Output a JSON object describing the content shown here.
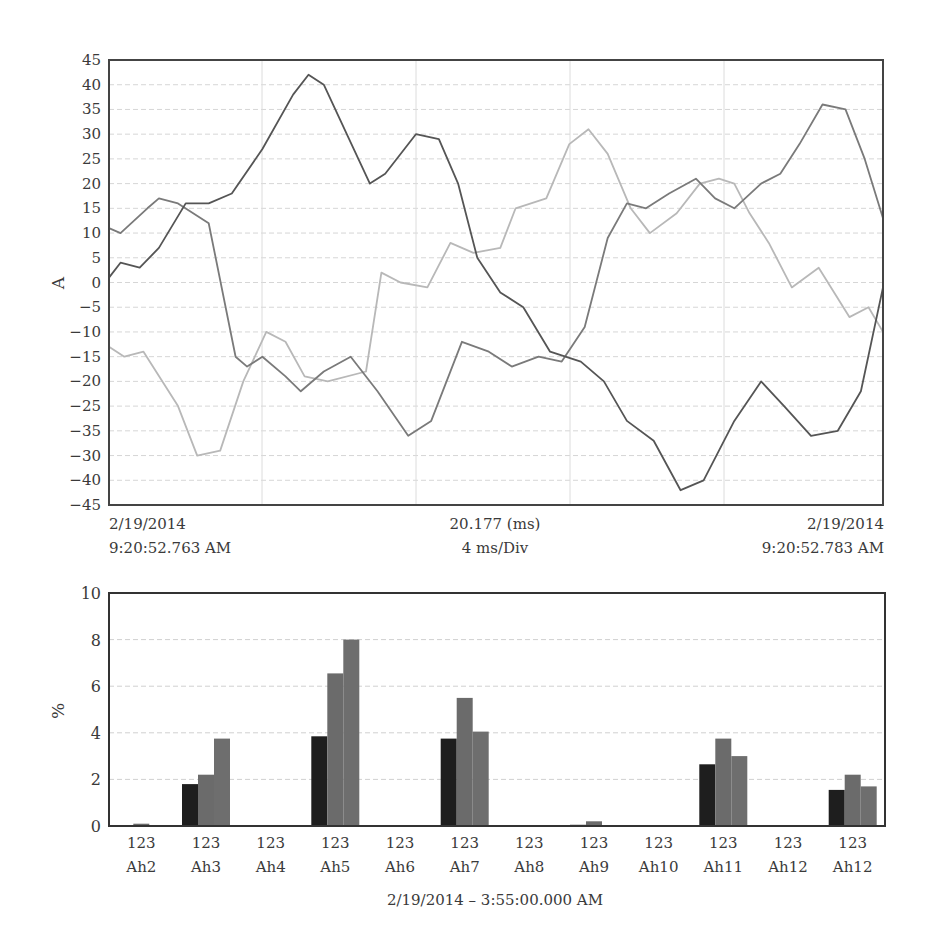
{
  "chart_data": [
    {
      "type": "line",
      "title": "",
      "xlabel": "",
      "ylabel": "A",
      "ylim": [
        -45,
        45
      ],
      "grid": true,
      "y_tick_labels": [
        "45",
        "40",
        "35",
        "30",
        "25",
        "20",
        "15",
        "10",
        "5",
        "0",
        "-5",
        "-10",
        "-15",
        "-20",
        "-25",
        "-35",
        "-30",
        "-40",
        "-45"
      ],
      "x_labels": {
        "left_date": "2/19/2014",
        "left_time": "9:20:52.763 AM",
        "center_top": "20.177 (ms)",
        "center_bottom": "4 ms/Div",
        "right_date": "2/19/2014",
        "right_time": "9:20:52.783 AM"
      },
      "x_range_ms": [
        0,
        20.177
      ],
      "series": [
        {
          "name": "phase-1",
          "color": "#555555",
          "x_ms": [
            0,
            0.3,
            0.8,
            1.3,
            2.0,
            2.6,
            3.2,
            4.0,
            4.8,
            5.2,
            5.6,
            6.2,
            6.8,
            7.2,
            8.0,
            8.6,
            9.1,
            9.6,
            10.2,
            10.8,
            11.5,
            12.3,
            12.9,
            13.5,
            14.2,
            14.9,
            15.5,
            16.3,
            17.0,
            17.6,
            18.3,
            19.0,
            19.6,
            20.177
          ],
          "values": [
            1,
            4,
            3,
            7,
            16,
            16,
            18,
            27,
            38,
            42,
            40,
            30,
            20,
            22,
            30,
            29,
            20,
            5,
            -2,
            -5,
            -14,
            -16,
            -20,
            -28,
            -32,
            -42,
            -40,
            -28,
            -20,
            -25,
            -31,
            -30,
            -22,
            -1
          ]
        },
        {
          "name": "phase-2",
          "color": "#7a7a7a",
          "x_ms": [
            0,
            0.3,
            1.0,
            1.3,
            1.8,
            2.6,
            3.3,
            3.6,
            4.0,
            4.6,
            5.0,
            5.6,
            6.3,
            7.0,
            7.8,
            8.4,
            9.2,
            9.9,
            10.5,
            11.2,
            11.8,
            12.4,
            13.0,
            13.5,
            14.0,
            14.6,
            15.3,
            15.8,
            16.3,
            17.0,
            17.5,
            18.0,
            18.6,
            19.2,
            19.7,
            20.177
          ],
          "values": [
            11,
            10,
            15,
            17,
            16,
            12,
            -15,
            -17,
            -15,
            -19,
            -22,
            -18,
            -15,
            -22,
            -31,
            -28,
            -12,
            -14,
            -17,
            -15,
            -16,
            -9,
            9,
            16,
            15,
            18,
            21,
            17,
            15,
            20,
            22,
            28,
            36,
            35,
            25,
            13
          ]
        },
        {
          "name": "phase-3",
          "color": "#b8b8b8",
          "x_ms": [
            0,
            0.4,
            0.9,
            1.8,
            2.3,
            2.9,
            3.5,
            4.1,
            4.6,
            5.1,
            5.7,
            6.7,
            7.1,
            7.6,
            8.3,
            8.9,
            9.5,
            10.2,
            10.6,
            11.4,
            12.0,
            12.5,
            13.0,
            13.6,
            14.1,
            14.8,
            15.4,
            15.9,
            16.3,
            16.7,
            17.2,
            17.8,
            18.5,
            19.3,
            19.8,
            20.177
          ],
          "values": [
            -13,
            -15,
            -14,
            -25,
            -35,
            -34,
            -20,
            -10,
            -12,
            -19,
            -20,
            -18,
            2,
            0,
            -1,
            8,
            6,
            7,
            15,
            17,
            28,
            31,
            26,
            15,
            10,
            14,
            20,
            21,
            20,
            14,
            8,
            -1,
            3,
            -7,
            -5,
            -10
          ]
        }
      ]
    },
    {
      "type": "bar",
      "title": "",
      "xlabel": "2/19/2014 – 3:55:00.000 AM",
      "ylabel": "%",
      "ylim": [
        0,
        10
      ],
      "grid": true,
      "y_tick_labels": [
        "10",
        "8",
        "6",
        "4",
        "2",
        "0"
      ],
      "categories": [
        "Ah2",
        "Ah3",
        "Ah4",
        "Ah5",
        "Ah6",
        "Ah7",
        "Ah8",
        "Ah9",
        "Ah10",
        "Ah11",
        "Ah12",
        "Ah12"
      ],
      "category_sublabels": [
        "123",
        "123",
        "123",
        "123",
        "123",
        "123",
        "123",
        "123",
        "123",
        "123",
        "123",
        "123"
      ],
      "series": [
        {
          "name": "1",
          "color": "#1e1e1e",
          "values": [
            0,
            1.8,
            0,
            3.85,
            0,
            3.75,
            0,
            0.05,
            0,
            2.65,
            0,
            1.55
          ]
        },
        {
          "name": "2",
          "color": "#6b6b6b",
          "values": [
            0.1,
            2.2,
            0,
            6.55,
            0,
            5.5,
            0,
            0.2,
            0,
            3.75,
            0,
            2.2
          ]
        },
        {
          "name": "3",
          "color": "#6e6e6e",
          "values": [
            0,
            3.75,
            0,
            8.0,
            0,
            4.05,
            0,
            0,
            0,
            3.0,
            0,
            1.7
          ]
        }
      ]
    }
  ]
}
